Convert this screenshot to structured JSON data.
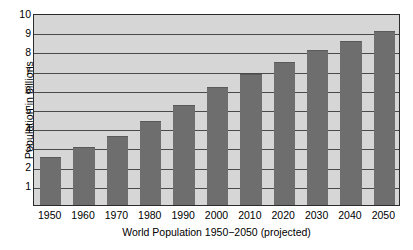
{
  "chart_data": {
    "type": "bar",
    "title": "",
    "xlabel": "World Population 1950−2050 (projected)",
    "ylabel": "Population in billions",
    "categories": [
      "1950",
      "1960",
      "1970",
      "1980",
      "1990",
      "2000",
      "2010",
      "2020",
      "2030",
      "2040",
      "2050"
    ],
    "values": [
      2.5,
      3.0,
      3.6,
      4.4,
      5.2,
      6.15,
      6.8,
      7.45,
      8.05,
      8.55,
      9.05
    ],
    "ylim": [
      0,
      10
    ],
    "y_ticks": [
      "10",
      "9",
      "8",
      "7",
      "6",
      "5",
      "4",
      "3",
      "2",
      "1"
    ],
    "y_tick_values": [
      10,
      9,
      8,
      7,
      6,
      5,
      4,
      3,
      2,
      1
    ],
    "grid": true,
    "legend": "none",
    "series_name": "World population",
    "colors": {
      "bar_fill": "#6e6e6e",
      "plot_background": "#d6d6d6",
      "gridline": "#4a4a4a",
      "axis_frame": "#2b2b2b",
      "text": "#000000",
      "page_background": "#ffffff"
    }
  }
}
